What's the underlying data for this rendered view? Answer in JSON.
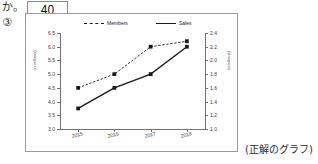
{
  "prefix_text": "か。",
  "answer_box_value": "40",
  "item_number": "③",
  "caption": "(正解のグラフ)",
  "legend": {
    "members_label": "Members",
    "sales_label": "Sales"
  },
  "colors": {
    "line": "#1a1a1a",
    "axis": "#707070",
    "frame": "#9b9b9b",
    "text": "#2a2a2a"
  },
  "chart_data": {
    "type": "line",
    "title": "",
    "xlabel": "",
    "grid": false,
    "legend_position": "top",
    "categories": [
      "2015",
      "2016",
      "2017",
      "2018"
    ],
    "left_axis": {
      "label": "(in millions)",
      "ylim": [
        3.0,
        6.5
      ],
      "ticks": [
        "6.5",
        "6.0",
        "5.5",
        "5.0",
        "4.5",
        "4.0",
        "3.5",
        "3.0"
      ],
      "tick_values": [
        6.5,
        6.0,
        5.5,
        5.0,
        4.5,
        4.0,
        3.5,
        3.0
      ]
    },
    "right_axis": {
      "label": "(in billions)",
      "ylim": [
        1.0,
        2.4
      ],
      "ticks": [
        "2.4",
        "2.2",
        "2.0",
        "1.8",
        "1.6",
        "1.4",
        "1.2",
        "1.0"
      ],
      "tick_values": [
        2.4,
        2.2,
        2.0,
        1.8,
        1.6,
        1.4,
        1.2,
        1.0
      ]
    },
    "series": [
      {
        "name": "Members",
        "axis": "left",
        "style": "dashed",
        "marker": "square",
        "values": [
          4.5,
          5.0,
          6.0,
          6.2
        ]
      },
      {
        "name": "Sales",
        "axis": "right",
        "style": "solid",
        "marker": "square",
        "values": [
          1.3,
          1.6,
          1.8,
          2.2
        ]
      }
    ]
  }
}
